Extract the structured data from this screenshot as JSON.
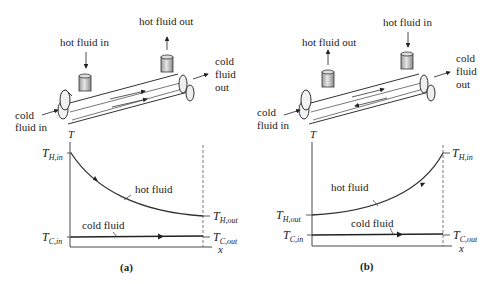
{
  "panels": [
    {
      "id": "a",
      "caption": "(a)",
      "flow_type": "parallel-flow",
      "exchanger": {
        "hot_in_label": "hot fluid in",
        "hot_out_label": "hot fluid out",
        "cold_in_label_1": "cold",
        "cold_in_label_2": "fluid in",
        "cold_out_label_1": "cold",
        "cold_out_label_2": "fluid",
        "cold_out_label_3": "out"
      },
      "graph": {
        "y_axis_label": "T",
        "x_axis_label": "x",
        "t_h_in": {
          "main": "T",
          "sub": "H,in"
        },
        "t_h_out": {
          "main": "T",
          "sub": "H,out"
        },
        "t_c_in": {
          "main": "T",
          "sub": "C,in"
        },
        "t_c_out": {
          "main": "T",
          "sub": "C,out"
        },
        "hot_curve_label": "hot fluid",
        "cold_curve_label": "cold fluid"
      }
    },
    {
      "id": "b",
      "caption": "(b)",
      "flow_type": "counter-flow",
      "exchanger": {
        "hot_in_label": "hot fluid in",
        "hot_out_label": "hot fluid out",
        "cold_in_label_1": "cold",
        "cold_in_label_2": "fluid in",
        "cold_out_label_1": "cold",
        "cold_out_label_2": "fluid",
        "cold_out_label_3": "out"
      },
      "graph": {
        "y_axis_label": "T",
        "x_axis_label": "x",
        "t_h_in": {
          "main": "T",
          "sub": "H,in"
        },
        "t_h_out": {
          "main": "T",
          "sub": "H,out"
        },
        "t_c_in": {
          "main": "T",
          "sub": "C,in"
        },
        "t_c_out": {
          "main": "T",
          "sub": "C,out"
        },
        "hot_curve_label": "hot fluid",
        "cold_curve_label": "cold fluid"
      }
    }
  ]
}
